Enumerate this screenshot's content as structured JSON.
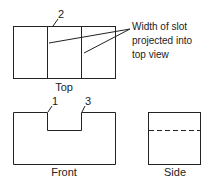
{
  "views": {
    "top": {
      "label": "Top"
    },
    "front": {
      "label": "Front"
    },
    "side": {
      "label": "Side"
    }
  },
  "callouts": {
    "point_1": "1",
    "point_2": "2",
    "point_3": "3"
  },
  "annotation": {
    "line1": "Width of slot",
    "line2": "projected into",
    "line3": "top view"
  },
  "colors": {
    "stroke": "#222222"
  }
}
